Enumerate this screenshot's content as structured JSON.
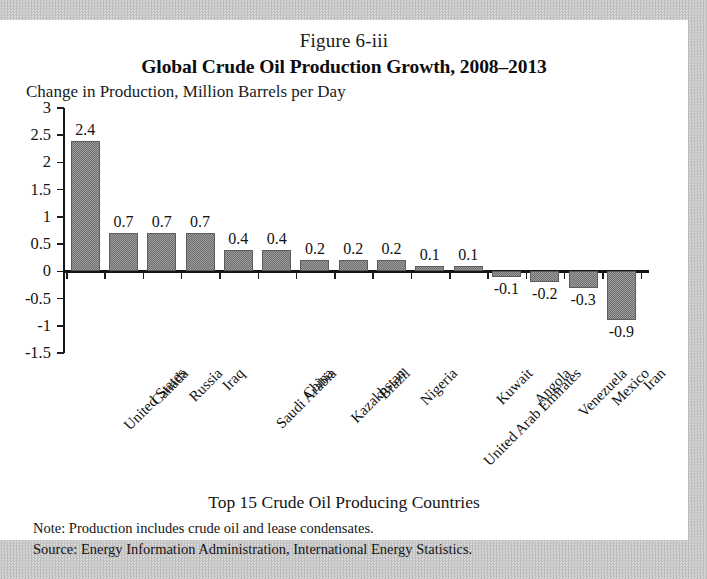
{
  "figure_number": "Figure 6-iii",
  "chart_data": {
    "type": "bar",
    "title": "Global Crude Oil Production Growth, 2008–2013",
    "ylabel": "Change in Production, Million Barrels per Day",
    "xlabel": "Top 15 Crude Oil Producing Countries",
    "categories": [
      "United States",
      "Canada",
      "Russia",
      "Iraq",
      "Saudi Arabia",
      "China",
      "Kazakhstan",
      "Brazil",
      "Nigeria",
      "United Arab Emirates",
      "Kuwait",
      "Angola",
      "Venezuela",
      "Mexico",
      "Iran"
    ],
    "values": [
      2.4,
      0.7,
      0.7,
      0.7,
      0.4,
      0.4,
      0.2,
      0.2,
      0.2,
      0.1,
      0.1,
      -0.1,
      -0.2,
      -0.3,
      -0.9
    ],
    "value_labels": [
      "2.4",
      "0.7",
      "0.7",
      "0.7",
      "0.4",
      "0.4",
      "0.2",
      "0.2",
      "0.2",
      "0.1",
      "0.1",
      "-0.1",
      "-0.2",
      "-0.3",
      "-0.9"
    ],
    "ylim": [
      -1.5,
      3
    ],
    "yticks": [
      3,
      2.5,
      2,
      1.5,
      1,
      0.5,
      0,
      -0.5,
      -1,
      -1.5
    ],
    "ytick_labels": [
      "3",
      "2.5",
      "2",
      "1.5",
      "1",
      "0.5",
      "0",
      "-0.5",
      "-1",
      "-1.5"
    ],
    "grid": false,
    "legend": null,
    "bar_color": "#8a8a8a",
    "axis_color": "#161616"
  },
  "footnotes": {
    "note": "Note: Production includes crude oil and lease condensates.",
    "source": "Source: Energy Information Administration, International Energy Statistics."
  }
}
